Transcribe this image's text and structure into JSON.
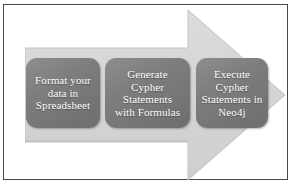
{
  "figure": {
    "frame_color": "#4a4a4a",
    "background_color": "#ffffff"
  },
  "arrow": {
    "name": "right-pointing-process-arrow",
    "fill_color": "#d4d4d4",
    "edge_color": "#c2c2c2",
    "direction": "right"
  },
  "steps": [
    {
      "index": 1,
      "label": "Format your\ndata in\nSpreadsheet",
      "fill_color": "#7d7d7d",
      "text_color": "#ffffff"
    },
    {
      "index": 2,
      "label": "Generate\nCypher\nStatements\nwith Formulas",
      "fill_color": "#7d7d7d",
      "text_color": "#ffffff"
    },
    {
      "index": 3,
      "label": "Execute\nCypher\nStatements in\nNeo4j",
      "fill_color": "#7d7d7d",
      "text_color": "#ffffff"
    }
  ]
}
